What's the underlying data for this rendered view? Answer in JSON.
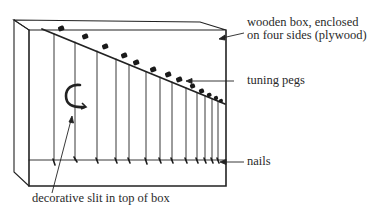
{
  "diagram": {
    "labels": {
      "box_line1": "wooden box, enclosed",
      "box_line2": "on four sides (plywood)",
      "pegs": "tuning pegs",
      "nails": "nails",
      "slit": "decorative slit in top of box"
    },
    "string_count": 13,
    "colors": {
      "ink": "#222222",
      "label_text": "#2a2a2a",
      "background": "#ffffff"
    }
  }
}
